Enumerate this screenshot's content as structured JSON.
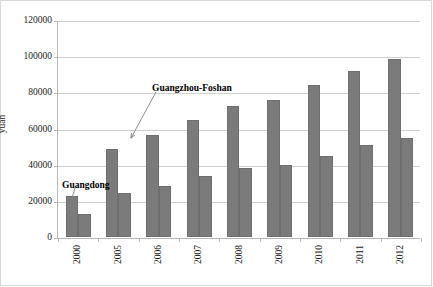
{
  "chart_data": {
    "type": "bar",
    "title": "",
    "xlabel": "",
    "ylabel": "yuan",
    "categories": [
      "2000",
      "2005",
      "2006",
      "2007",
      "2008",
      "2009",
      "2010",
      "2011",
      "2012"
    ],
    "series": [
      {
        "name": "Guangzhou-Foshan",
        "values": [
          22500,
          48500,
          56500,
          64500,
          72500,
          75500,
          84000,
          92000,
          98500
        ]
      },
      {
        "name": "Guangdong",
        "values": [
          13000,
          24500,
          28000,
          34000,
          38000,
          40000,
          45000,
          51000,
          54500
        ]
      }
    ],
    "ylim": [
      0,
      120000
    ],
    "ytick_values": [
      0,
      20000,
      40000,
      60000,
      80000,
      100000,
      120000
    ],
    "ytick_labels": [
      "0",
      "20000",
      "40000",
      "60000",
      "80000",
      "100000",
      "120000"
    ],
    "grid": true,
    "legend": "none",
    "bar_color": "#7b7b7b",
    "gridline_color": "#d0d0d0",
    "axis_color": "#b9b9b9",
    "annotations": [
      {
        "name": "guangzhou-foshan",
        "label": "Guangzhou-Foshan",
        "text_x": 152,
        "text_y": 83,
        "arrow_from_x": 156,
        "arrow_from_y": 92,
        "arrow_to_x": 131,
        "arrow_to_y": 138
      },
      {
        "name": "guangdong",
        "label": "Guangdong",
        "text_x": 62,
        "text_y": 180,
        "arrow_from_x": 75,
        "arrow_from_y": 188,
        "arrow_to_x": 67,
        "arrow_to_y": 215
      }
    ]
  }
}
